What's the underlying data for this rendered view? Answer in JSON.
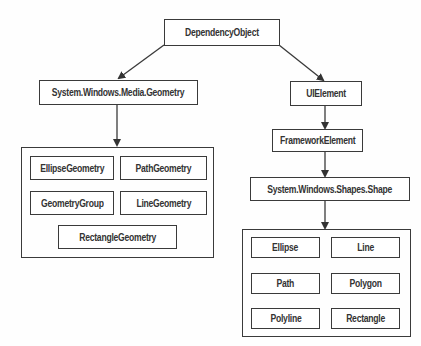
{
  "diagram": {
    "type": "class-hierarchy",
    "root": {
      "label": "DependencyObject"
    },
    "left_branch": {
      "label": "System.Windows.Media.Geometry",
      "children": [
        "EllipseGeometry",
        "PathGeometry",
        "GeometryGroup",
        "LineGeometry",
        "RectangleGeometry"
      ]
    },
    "right_branch": {
      "chain": [
        "UIElement",
        "FrameworkElement",
        "System.Windows.Shapes.Shape"
      ],
      "children": [
        "Ellipse",
        "Line",
        "Path",
        "Polygon",
        "Polyline",
        "Rectangle"
      ]
    },
    "edges": [
      [
        "DependencyObject",
        "System.Windows.Media.Geometry"
      ],
      [
        "DependencyObject",
        "UIElement"
      ],
      [
        "System.Windows.Media.Geometry",
        "geometry-group-container"
      ],
      [
        "UIElement",
        "FrameworkElement"
      ],
      [
        "FrameworkElement",
        "System.Windows.Shapes.Shape"
      ],
      [
        "System.Windows.Shapes.Shape",
        "shapes-group-container"
      ]
    ],
    "colors": {
      "stroke": "#3a3a3a",
      "text": "#333333",
      "background": "#ffffff"
    }
  }
}
